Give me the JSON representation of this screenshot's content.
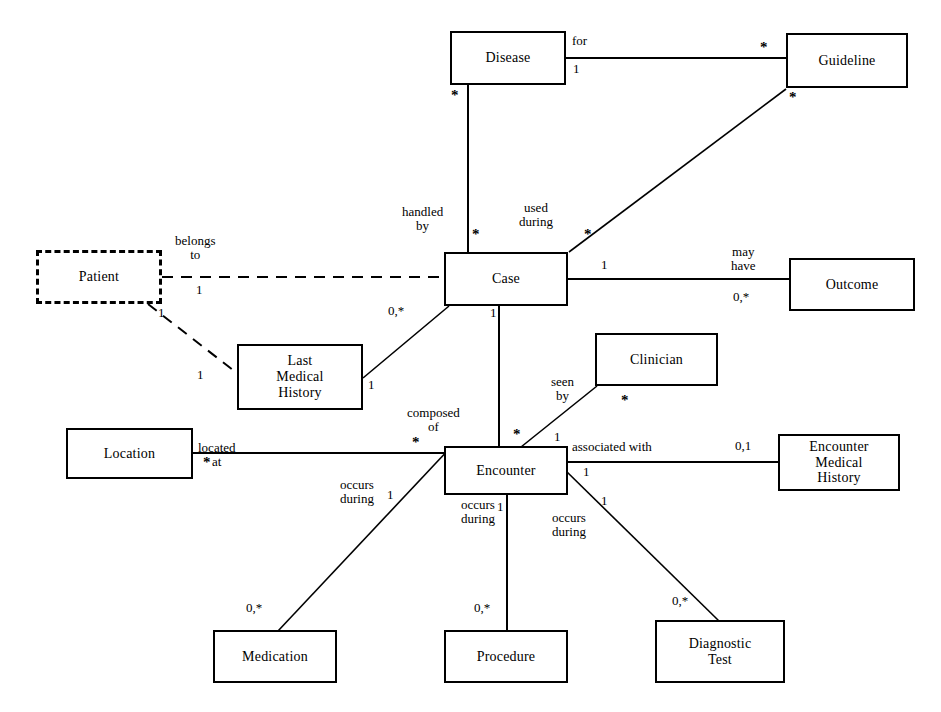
{
  "diagram": {
    "type": "er-diagram",
    "line_color": "#000000",
    "background_color": "#ffffff",
    "entities": [
      {
        "id": "disease",
        "label": "Disease",
        "x": 450,
        "y": 31,
        "w": 116,
        "h": 54,
        "style": "solid"
      },
      {
        "id": "guideline",
        "label": "Guideline",
        "x": 786,
        "y": 33,
        "w": 122,
        "h": 55,
        "style": "solid"
      },
      {
        "id": "patient",
        "label": "Patient",
        "x": 36,
        "y": 250,
        "w": 126,
        "h": 54,
        "style": "dashed"
      },
      {
        "id": "case",
        "label": "Case",
        "x": 444,
        "y": 252,
        "w": 124,
        "h": 54,
        "style": "solid"
      },
      {
        "id": "outcome",
        "label": "Outcome",
        "x": 789,
        "y": 258,
        "w": 126,
        "h": 53,
        "style": "solid"
      },
      {
        "id": "lastmh",
        "label": "Last\nMedical\nHistory",
        "x": 237,
        "y": 344,
        "w": 126,
        "h": 66,
        "style": "solid"
      },
      {
        "id": "clinician",
        "label": "Clinician",
        "x": 595,
        "y": 333,
        "w": 123,
        "h": 53,
        "style": "solid"
      },
      {
        "id": "location",
        "label": "Location",
        "x": 66,
        "y": 428,
        "w": 127,
        "h": 51,
        "style": "solid"
      },
      {
        "id": "encounter",
        "label": "Encounter",
        "x": 444,
        "y": 446,
        "w": 124,
        "h": 49,
        "style": "solid"
      },
      {
        "id": "encmh",
        "label": "Encounter\nMedical\nHistory",
        "x": 778,
        "y": 434,
        "w": 122,
        "h": 57,
        "style": "solid"
      },
      {
        "id": "medication",
        "label": "Medication",
        "x": 213,
        "y": 630,
        "w": 124,
        "h": 53,
        "style": "solid"
      },
      {
        "id": "procedure",
        "label": "Procedure",
        "x": 444,
        "y": 630,
        "w": 124,
        "h": 53,
        "style": "solid"
      },
      {
        "id": "diagtest",
        "label": "Diagnostic\nTest",
        "x": 655,
        "y": 620,
        "w": 130,
        "h": 63,
        "style": "solid"
      }
    ],
    "relationships": [
      {
        "id": "disease-guideline",
        "from": "disease",
        "to": "guideline",
        "label": "for",
        "from_mult": "1",
        "to_mult": "*",
        "style": "solid"
      },
      {
        "id": "disease-case",
        "from": "disease",
        "to": "case",
        "label": "handled\nby",
        "from_mult": "*",
        "to_mult": "*",
        "style": "solid"
      },
      {
        "id": "guideline-case",
        "from": "guideline",
        "to": "case",
        "label": "used\nduring",
        "from_mult": "*",
        "to_mult": "*",
        "style": "solid"
      },
      {
        "id": "patient-case",
        "from": "patient",
        "to": "case",
        "label": "belongs\nto",
        "from_mult": "1",
        "to_mult": "0,*",
        "style": "dashed"
      },
      {
        "id": "patient-lastmh",
        "from": "patient",
        "to": "lastmh",
        "label": "",
        "from_mult": "1",
        "to_mult": "1",
        "style": "dashed"
      },
      {
        "id": "case-outcome",
        "from": "case",
        "to": "outcome",
        "label": "may\nhave",
        "from_mult": "1",
        "to_mult": "0,*",
        "style": "solid"
      },
      {
        "id": "case-lastmh",
        "from": "case",
        "to": "lastmh",
        "label": "",
        "from_mult": "0,*",
        "to_mult": "1",
        "style": "solid"
      },
      {
        "id": "case-encounter",
        "from": "case",
        "to": "encounter",
        "label": "composed\nof",
        "from_mult": "1",
        "to_mult": "*",
        "style": "solid"
      },
      {
        "id": "location-encounter",
        "from": "location",
        "to": "encounter",
        "label": "located\nat",
        "from_mult": "*",
        "to_mult": "*",
        "style": "solid"
      },
      {
        "id": "clinician-encounter",
        "from": "clinician",
        "to": "encounter",
        "label": "seen\nby",
        "from_mult": "*",
        "to_mult": "1",
        "style": "solid"
      },
      {
        "id": "encounter-encmh",
        "from": "encounter",
        "to": "encmh",
        "label": "associated with",
        "from_mult": "1",
        "to_mult": "0,1",
        "style": "solid"
      },
      {
        "id": "encounter-medication",
        "from": "encounter",
        "to": "medication",
        "label": "occurs\nduring",
        "from_mult": "1",
        "to_mult": "0,*",
        "style": "solid"
      },
      {
        "id": "encounter-procedure",
        "from": "encounter",
        "to": "procedure",
        "label": "occurs\nduring",
        "from_mult": "1",
        "to_mult": "0,*",
        "style": "solid"
      },
      {
        "id": "encounter-diagtest",
        "from": "encounter",
        "to": "diagtest",
        "label": "occurs\nduring",
        "from_mult": "1",
        "to_mult": "0,*",
        "style": "solid"
      }
    ],
    "edge_labels": [
      {
        "id": "lbl-for",
        "text": "for",
        "x": 572,
        "y": 38
      },
      {
        "id": "lbl-handled-by",
        "text": "handled\nby",
        "x": 404,
        "y": 207
      },
      {
        "id": "lbl-used-during",
        "text": "used\nduring",
        "x": 520,
        "y": 203
      },
      {
        "id": "lbl-belongs-to",
        "text": "belongs\nto",
        "x": 174,
        "y": 236
      },
      {
        "id": "lbl-may-have",
        "text": "may\nhave",
        "x": 730,
        "y": 247
      },
      {
        "id": "lbl-seen-by",
        "text": "seen\nby",
        "x": 551,
        "y": 377
      },
      {
        "id": "lbl-composed-of",
        "text": "composed\nof",
        "x": 409,
        "y": 408
      },
      {
        "id": "lbl-located-at",
        "text": "located\nat",
        "x": 197,
        "y": 443
      },
      {
        "id": "lbl-associated",
        "text": "associated with",
        "x": 570,
        "y": 442
      },
      {
        "id": "lbl-occurs-1",
        "text": "occurs\nduring",
        "x": 340,
        "y": 480
      },
      {
        "id": "lbl-occurs-2",
        "text": "occurs\nduring",
        "x": 462,
        "y": 500
      },
      {
        "id": "lbl-occurs-3",
        "text": "occurs\nduring",
        "x": 552,
        "y": 513
      }
    ],
    "multiplicity_labels": [
      {
        "id": "m-disease-for-1",
        "text": "1",
        "x": 572,
        "y": 66
      },
      {
        "id": "m-guideline-for-star",
        "text": "*",
        "x": 760,
        "y": 47
      },
      {
        "id": "m-disease-down-star",
        "text": "*",
        "x": 452,
        "y": 93
      },
      {
        "id": "m-guideline-diag-star",
        "text": "*",
        "x": 789,
        "y": 95
      },
      {
        "id": "m-case-handled-star",
        "text": "*",
        "x": 473,
        "y": 232
      },
      {
        "id": "m-case-used-star",
        "text": "*",
        "x": 584,
        "y": 232
      },
      {
        "id": "m-patient-1",
        "text": "1",
        "x": 195,
        "y": 288
      },
      {
        "id": "m-case-outcome-1",
        "text": "1",
        "x": 600,
        "y": 261
      },
      {
        "id": "m-outcome-0star",
        "text": "0,*",
        "x": 735,
        "y": 293
      },
      {
        "id": "m-case-lastmh-0star",
        "text": "0,*",
        "x": 389,
        "y": 307
      },
      {
        "id": "m-patient-lastmh-1a",
        "text": "1",
        "x": 158,
        "y": 310
      },
      {
        "id": "m-patient-lastmh-1b",
        "text": "1",
        "x": 197,
        "y": 372
      },
      {
        "id": "m-lastmh-case-1",
        "text": "1",
        "x": 368,
        "y": 382
      },
      {
        "id": "m-case-enc-1",
        "text": "1",
        "x": 490,
        "y": 310
      },
      {
        "id": "m-enc-case-star",
        "text": "*",
        "x": 513,
        "y": 432
      },
      {
        "id": "m-clinician-star",
        "text": "*",
        "x": 621,
        "y": 398
      },
      {
        "id": "m-enc-clin-1",
        "text": "1",
        "x": 554,
        "y": 434
      },
      {
        "id": "m-location-star",
        "text": "*",
        "x": 203,
        "y": 460
      },
      {
        "id": "m-enc-loc-star",
        "text": "*",
        "x": 412,
        "y": 440
      },
      {
        "id": "m-encmh-01",
        "text": "0,1",
        "x": 736,
        "y": 442
      },
      {
        "id": "m-enc-encmh-1",
        "text": "1",
        "x": 582,
        "y": 468
      },
      {
        "id": "m-enc-med-1",
        "text": "1",
        "x": 387,
        "y": 492
      },
      {
        "id": "m-enc-proc-1",
        "text": "1",
        "x": 496,
        "y": 504
      },
      {
        "id": "m-enc-diag-1",
        "text": "1",
        "x": 600,
        "y": 498
      },
      {
        "id": "m-med-0star",
        "text": "0,*",
        "x": 247,
        "y": 605
      },
      {
        "id": "m-proc-0star",
        "text": "0,*",
        "x": 474,
        "y": 605
      },
      {
        "id": "m-diag-0star",
        "text": "0,*",
        "x": 672,
        "y": 598
      }
    ],
    "edges_geometry": [
      {
        "id": "e-disease-guideline",
        "points": "566,58 786,58",
        "style": "solid"
      },
      {
        "id": "e-disease-case",
        "points": "468,85 468,252",
        "style": "solid"
      },
      {
        "id": "e-guideline-case",
        "points": "786,88 568,252",
        "style": "solid"
      },
      {
        "id": "e-patient-case",
        "points": "162,277 444,277",
        "style": "dashed"
      },
      {
        "id": "e-patient-lastmh",
        "points": "150,304 237,372",
        "style": "dashed"
      },
      {
        "id": "e-case-outcome",
        "points": "568,279 789,279",
        "style": "solid"
      },
      {
        "id": "e-case-lastmh",
        "points": "448,306 363,377",
        "style": "solid"
      },
      {
        "id": "e-case-encounter",
        "points": "498,306 498,446",
        "style": "solid"
      },
      {
        "id": "e-location-encounter",
        "points": "193,453 444,453",
        "style": "solid"
      },
      {
        "id": "e-clinician-encounter",
        "points": "596,386 520,447",
        "style": "solid"
      },
      {
        "id": "e-encounter-encmh",
        "points": "568,462 778,462",
        "style": "solid"
      },
      {
        "id": "e-encounter-medication",
        "points": "450,447 277,630",
        "style": "solid"
      },
      {
        "id": "e-encounter-procedure",
        "points": "506,495 506,630",
        "style": "solid"
      },
      {
        "id": "e-encounter-diagtest",
        "points": "564,470 718,620",
        "style": "solid"
      }
    ]
  }
}
